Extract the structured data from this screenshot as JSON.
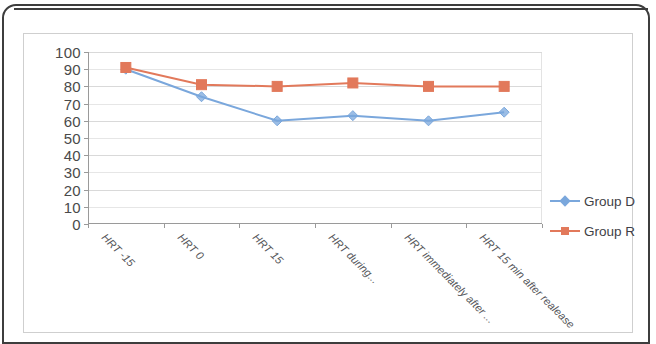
{
  "chart_data": {
    "type": "line",
    "title": "",
    "subtitle": "",
    "xlabel": "",
    "ylabel": "",
    "ylim": [
      0,
      100
    ],
    "yticks": [
      0,
      10,
      20,
      30,
      40,
      50,
      60,
      70,
      80,
      90,
      100
    ],
    "grid": true,
    "legend_position": "right",
    "categories": [
      "HRT -15",
      "HRT 0",
      "HRT 15",
      "HRT during...",
      "HRT immediately after ...",
      "HRT 15 min after realease"
    ],
    "series": [
      {
        "name": "Group D",
        "color": "#7AA7DC",
        "marker": "diamond",
        "values": [
          90,
          74,
          60,
          63,
          60,
          65
        ]
      },
      {
        "name": "Group R",
        "color": "#E2795B",
        "marker": "square",
        "values": [
          91,
          81,
          80,
          82,
          80,
          80
        ]
      }
    ]
  },
  "legend": {
    "items": [
      {
        "label": "Group D"
      },
      {
        "label": "Group R"
      }
    ]
  },
  "colors": {
    "series_d": "#7AA7DC",
    "series_r": "#E2795B",
    "gridline": "#d9d9d9",
    "axis": "#9a9a9a",
    "axis_text": "#4a4a4a",
    "category_text": "#55565a",
    "page_border": "#3d3d3d",
    "chart_border": "#cfcfcf"
  }
}
